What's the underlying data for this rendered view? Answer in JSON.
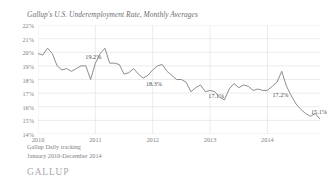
{
  "chart_data": {
    "type": "line",
    "title": "Gallup's U.S. Underemployment Rate, Monthly Averages",
    "xlabel": "",
    "ylabel": "",
    "ylim": [
      14,
      22
    ],
    "ytick_labels": [
      "22%",
      "21%",
      "20%",
      "19%",
      "18%",
      "17%",
      "16%",
      "15%",
      "14%"
    ],
    "ytick_values": [
      22,
      21,
      20,
      19,
      18,
      17,
      16,
      15,
      14
    ],
    "xtick_labels": [
      "2010",
      "2011",
      "2012",
      "2013",
      "2014"
    ],
    "xtick_values": [
      0,
      12,
      24,
      36,
      48
    ],
    "grid": true,
    "legend": "none",
    "line_color": "#8c8e90",
    "x": [
      0,
      1,
      2,
      3,
      4,
      5,
      6,
      7,
      8,
      9,
      10,
      11,
      12,
      13,
      14,
      15,
      16,
      17,
      18,
      19,
      20,
      21,
      22,
      23,
      24,
      25,
      26,
      27,
      28,
      29,
      30,
      31,
      32,
      33,
      34,
      35,
      36,
      37,
      38,
      39,
      40,
      41,
      42,
      43,
      44,
      45,
      46,
      47,
      48,
      49,
      50,
      51,
      52,
      53,
      54,
      55,
      56,
      57,
      58,
      59
    ],
    "x_month_labels": [
      "Jan 2010",
      "Feb 2010",
      "Mar 2010",
      "Apr 2010",
      "May 2010",
      "Jun 2010",
      "Jul 2010",
      "Aug 2010",
      "Sep 2010",
      "Oct 2010",
      "Nov 2010",
      "Dec 2010",
      "Jan 2011",
      "Feb 2011",
      "Mar 2011",
      "Apr 2011",
      "May 2011",
      "Jun 2011",
      "Jul 2011",
      "Aug 2011",
      "Sep 2011",
      "Oct 2011",
      "Nov 2011",
      "Dec 2011",
      "Jan 2012",
      "Feb 2012",
      "Mar 2012",
      "Apr 2012",
      "May 2012",
      "Jun 2012",
      "Jul 2012",
      "Aug 2012",
      "Sep 2012",
      "Oct 2012",
      "Nov 2012",
      "Dec 2012",
      "Jan 2013",
      "Feb 2013",
      "Mar 2013",
      "Apr 2013",
      "May 2013",
      "Jun 2013",
      "Jul 2013",
      "Aug 2013",
      "Sep 2013",
      "Oct 2013",
      "Nov 2013",
      "Dec 2013",
      "Jan 2014",
      "Feb 2014",
      "Mar 2014",
      "Apr 2014",
      "May 2014",
      "Jun 2014",
      "Jul 2014",
      "Aug 2014",
      "Sep 2014",
      "Oct 2014",
      "Nov 2014",
      "Dec 2014"
    ],
    "values": [
      19.9,
      19.8,
      20.3,
      19.9,
      19.0,
      18.7,
      18.8,
      18.6,
      18.8,
      19.0,
      19.0,
      18.0,
      19.2,
      19.9,
      20.3,
      19.2,
      19.2,
      19.1,
      18.4,
      18.5,
      18.8,
      18.4,
      18.1,
      18.3,
      18.7,
      19.0,
      19.1,
      18.6,
      18.3,
      18.0,
      18.0,
      17.8,
      17.1,
      17.4,
      17.6,
      17.1,
      17.2,
      17.1,
      16.7,
      16.5,
      17.3,
      17.7,
      17.4,
      17.6,
      17.5,
      17.2,
      17.3,
      17.2,
      17.2,
      17.5,
      17.8,
      18.6,
      17.5,
      16.8,
      16.2,
      15.8,
      15.5,
      15.3,
      15.5,
      15.1
    ],
    "point_labels": [
      {
        "text": "19.2%",
        "x_index": 12,
        "value": 19.2
      },
      {
        "text": "18.3%",
        "x_index": 23,
        "value": 18.3
      },
      {
        "text": "17.1%",
        "x_index": 35,
        "value": 17.1
      },
      {
        "text": "17.2%",
        "x_index": 48,
        "value": 17.2
      },
      {
        "text": "15.1%",
        "x_index": 59,
        "value": 15.1
      }
    ]
  },
  "footer": {
    "source_line_1": "Gallup Daily tracking",
    "source_line_2": "January 2010-December 2014",
    "brand": "GALLUP"
  }
}
